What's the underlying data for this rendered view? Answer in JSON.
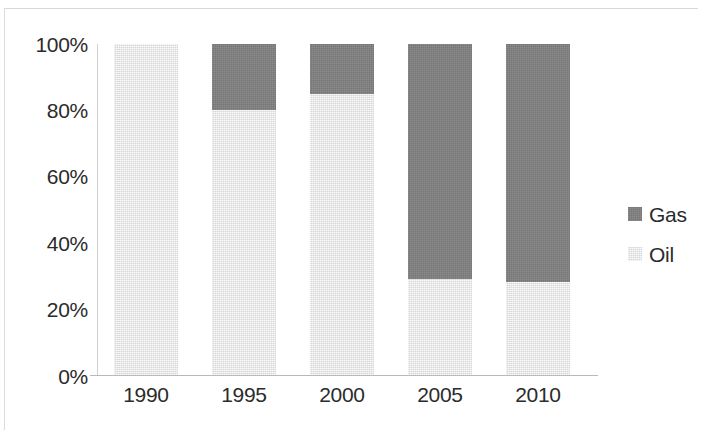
{
  "chart_data": {
    "type": "bar",
    "subtype": "stacked-100-percent",
    "title": "",
    "subtitle": "",
    "xlabel": "",
    "ylabel": "",
    "categories": [
      "1990",
      "1995",
      "2000",
      "2005",
      "2010"
    ],
    "series": [
      {
        "name": "Gas",
        "values": [
          0,
          20,
          15,
          71,
          72
        ],
        "color": "#7f7f7f"
      },
      {
        "name": "Oil",
        "values": [
          100,
          80,
          85,
          29,
          28
        ],
        "color": "#e3e3e3"
      }
    ],
    "stack_order_top_to_bottom": [
      "Gas",
      "Oil"
    ],
    "ylim": [
      0,
      100
    ],
    "yticks": [
      "0%",
      "20%",
      "40%",
      "60%",
      "80%",
      "100%"
    ],
    "ytick_values": [
      0,
      20,
      40,
      60,
      80,
      100
    ],
    "ytick_format": "percent",
    "grid": false,
    "legend_position": "right",
    "legend": [
      {
        "label": "Gas",
        "color": "#7f7f7f"
      },
      {
        "label": "Oil",
        "color": "#e3e3e3"
      }
    ]
  },
  "axis": {
    "y_labels": [
      "100%",
      "80%",
      "60%",
      "40%",
      "20%",
      "0%"
    ],
    "x_labels": [
      "1990",
      "1995",
      "2000",
      "2005",
      "2010"
    ]
  },
  "colors": {
    "gas": "#7f7f7f",
    "oil": "#e3e3e3",
    "text": "#2b2b2b",
    "axis": "#b9b9b9",
    "background": "#ffffff"
  }
}
